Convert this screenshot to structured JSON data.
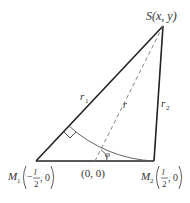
{
  "diagram": {
    "points": {
      "S": {
        "label": "S(x, y)"
      },
      "M1": {
        "name": "M",
        "sub": "1",
        "coord_num": "l",
        "coord_den": "2",
        "sign": "−",
        "tail": ", 0"
      },
      "M2": {
        "name": "M",
        "sub": "2",
        "coord_num": "l",
        "coord_den": "2",
        "sign": "",
        "tail": ", 0"
      },
      "O": {
        "label": "(0, 0)"
      }
    },
    "segments": {
      "r1": {
        "name": "r",
        "sub": "1"
      },
      "r2": {
        "name": "r",
        "sub": "2"
      },
      "r": {
        "name": "r"
      }
    },
    "angle": {
      "label": "φ"
    },
    "colors": {
      "line": "#222222",
      "dashed": "#777777",
      "arc": "#555555"
    }
  }
}
